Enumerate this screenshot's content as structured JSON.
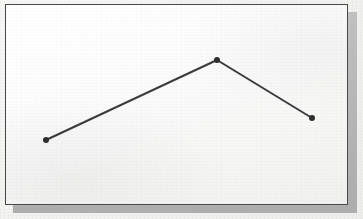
{
  "figure": {
    "kind": "scanned-line-chart-figure",
    "frame_border_color": "#4a4a4a",
    "shadow_color": "#ababab",
    "paper_color": "#f3f3f2",
    "plot_background_color": "#fbfbfa"
  },
  "chart_data": {
    "type": "line",
    "title": "",
    "subtitle": "",
    "xlabel": "",
    "ylabel": "",
    "grid": false,
    "legend": false,
    "legend_position": "none",
    "axis_visible": false,
    "tick_labels_x": [],
    "tick_labels_y": [],
    "annotations": [],
    "x": [
      1,
      2,
      3
    ],
    "xlim": [
      0,
      4
    ],
    "ylim": [
      0,
      100
    ],
    "series": [
      {
        "name": "",
        "color": "#3b3b3b",
        "line_width": 2,
        "marker": "circle",
        "marker_size": 4,
        "values": [
          22,
          100,
          53
        ]
      }
    ],
    "points_px": [
      {
        "x": 40,
        "y": 135
      },
      {
        "x": 211,
        "y": 55
      },
      {
        "x": 306,
        "y": 113
      }
    ]
  }
}
